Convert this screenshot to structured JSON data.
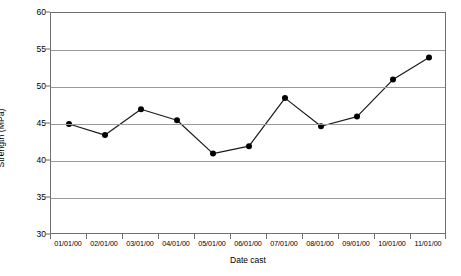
{
  "chart_data": {
    "type": "line",
    "title": "",
    "xlabel": "Date cast",
    "ylabel": "Strength (MPa)",
    "categories": [
      "01/01/00",
      "02/01/00",
      "03/01/00",
      "04/01/00",
      "05/01/00",
      "06/01/00",
      "07/01/00",
      "08/01/00",
      "09/01/00",
      "10/01/00",
      "11/01/00"
    ],
    "values": [
      45.0,
      43.5,
      47.0,
      45.5,
      41.0,
      42.0,
      48.5,
      44.7,
      46.0,
      51.0,
      54.0
    ],
    "series": [
      {
        "name": "Strength",
        "values": [
          45.0,
          43.5,
          47.0,
          45.5,
          41.0,
          42.0,
          48.5,
          44.7,
          46.0,
          51.0,
          54.0
        ]
      }
    ],
    "ylim": [
      30,
      60
    ],
    "yticks": [
      30,
      35,
      40,
      45,
      50,
      55,
      60
    ],
    "ytick_labels": [
      "30",
      "35",
      "40",
      "45",
      "50",
      "55",
      "60"
    ],
    "grid": true,
    "grid_axis": "y",
    "legend": false,
    "legend_position": "none",
    "marker": "circle",
    "marker_color": "#000000",
    "line_color": "#1a1a1a",
    "gridline_color": "#9a9a9a",
    "frame_color": "#6f6f6f",
    "background_color": "#ffffff"
  }
}
